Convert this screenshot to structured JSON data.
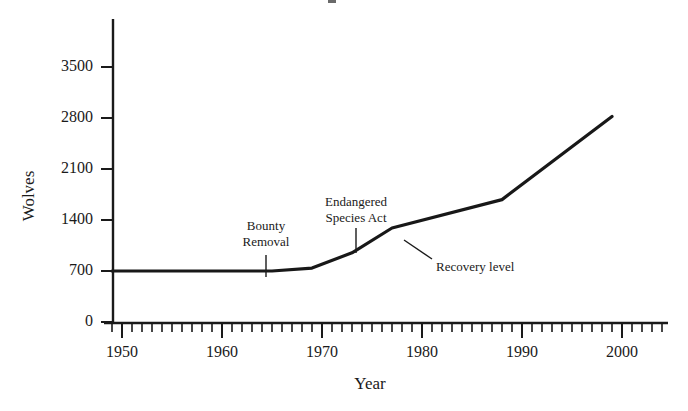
{
  "chart_data": {
    "type": "line",
    "title": "",
    "xlabel": "Year",
    "ylabel": "Wolves",
    "xlim": [
      1948,
      2004
    ],
    "ylim": [
      0,
      3900
    ],
    "grid": false,
    "legend": null,
    "x_major_ticks": [
      1950,
      1960,
      1970,
      1980,
      1990,
      2000
    ],
    "x_major_tick_labels": [
      "1950",
      "1960",
      "1970",
      "1980",
      "1990",
      "2000"
    ],
    "x_minor_tick_interval": 1,
    "y_ticks": [
      0,
      700,
      1400,
      2100,
      2800,
      3500
    ],
    "y_tick_labels": [
      "0",
      "700",
      "1400",
      "2100",
      "2800",
      "3500"
    ],
    "series": [
      {
        "name": "Wolves",
        "x": [
          1949,
          1965,
          1969,
          1973,
          1977,
          1988,
          1999
        ],
        "values": [
          700,
          700,
          740,
          950,
          1290,
          1680,
          2820
        ]
      }
    ],
    "annotations": [
      {
        "id": "bounty-removal",
        "label": "Bounty\nRemoval",
        "line1": "Bounty",
        "line2": "Removal",
        "x": 1964,
        "y": 700
      },
      {
        "id": "endangered-species-act",
        "label": "Endangered\nSpecies Act",
        "line1": "Endangered",
        "line2": "Species  Act",
        "x": 1973,
        "y": 950
      },
      {
        "id": "recovery-level",
        "label": "Recovery level",
        "line1": "Recovery level",
        "x": 1977,
        "y": 1290
      }
    ],
    "line_color": "#181818",
    "axis_color": "#1a1a1a",
    "background_color": "#ffffff"
  }
}
